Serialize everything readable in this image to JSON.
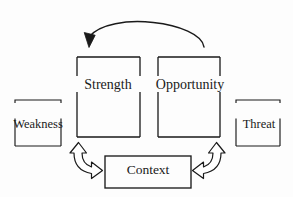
{
  "diagram": {
    "background_color": "#fdfdfd",
    "stroke_color": "#1a1a1a",
    "nodes": [
      {
        "id": "weakness",
        "label": "Weakness",
        "shape": "split-bracket-box",
        "position": "left-outer"
      },
      {
        "id": "strength",
        "label": "Strength",
        "shape": "split-bracket-box",
        "position": "left-inner"
      },
      {
        "id": "opportunity",
        "label": "Opportunity",
        "shape": "split-bracket-box",
        "position": "right-inner"
      },
      {
        "id": "threat",
        "label": "Threat",
        "shape": "split-bracket-box",
        "position": "right-outer"
      },
      {
        "id": "context",
        "label": "Context",
        "shape": "rectangle",
        "position": "bottom-center"
      }
    ],
    "connectors": [
      {
        "id": "opportunity-to-strength-arc",
        "type": "curved-arrow",
        "direction": "right-to-left",
        "from": "opportunity",
        "to": "strength"
      },
      {
        "id": "strength-context-arrow",
        "type": "curved-double-block-arrow",
        "direction": "bidirectional",
        "from": "strength",
        "to": "context"
      },
      {
        "id": "opportunity-context-arrow",
        "type": "curved-double-block-arrow",
        "direction": "bidirectional",
        "from": "opportunity",
        "to": "context"
      }
    ]
  }
}
